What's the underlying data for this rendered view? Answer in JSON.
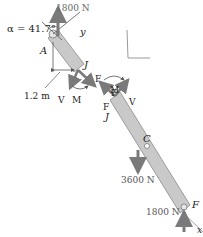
{
  "diagram": {
    "angle_label": "α = 41.7°",
    "points": {
      "A": "A",
      "J_upper": "J",
      "J_lower": "J",
      "C": "C",
      "F": "F"
    },
    "axes": {
      "x": "x",
      "y": "y"
    },
    "forces": {
      "top_load": "1800 N",
      "center_load": "3600 N",
      "bottom_reaction": "1800 N"
    },
    "dimension": "1.2 m",
    "internal_upper": {
      "V": "V",
      "M": "M",
      "F": "F"
    },
    "internal_lower": {
      "F": "F",
      "M": "M",
      "V": "V"
    },
    "colors": {
      "member_fill": "#c9c9c9",
      "member_stroke": "#8a8a8a",
      "arrow": "#7a7a7a",
      "text": "#222222"
    }
  }
}
